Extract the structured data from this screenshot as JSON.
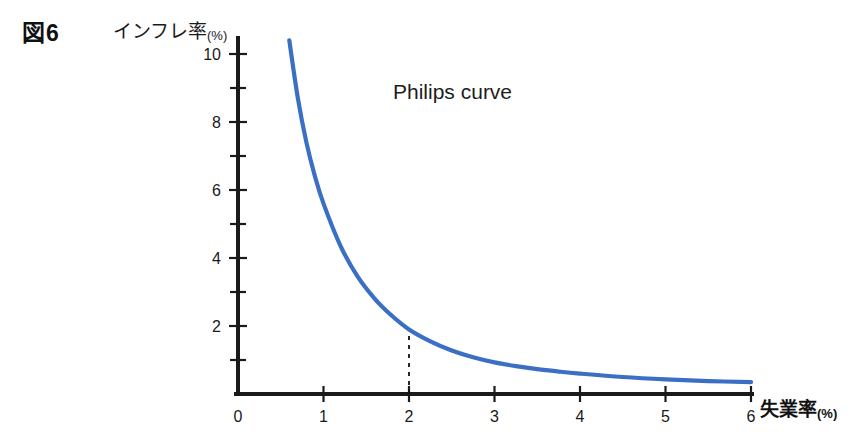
{
  "figure": {
    "number_label": "図6",
    "annotation": "Philips curve"
  },
  "axes": {
    "y_title_text": "インフレ率",
    "y_title_unit": "(%)",
    "x_title_text": "失業率",
    "x_title_unit": "(%)",
    "y_tick_labels": [
      "10",
      "8",
      "6",
      "4",
      "2"
    ],
    "x_tick_labels": [
      "0",
      "1",
      "2",
      "3",
      "4",
      "5",
      "6"
    ]
  },
  "colors": {
    "curve": "#3a6fc4",
    "axis": "#1a1a1a",
    "background": "#ffffff",
    "text": "#1a1a1a"
  },
  "chart_data": {
    "type": "line",
    "title": "Philips curve",
    "xlabel": "失業率(%)",
    "ylabel": "インフレ率(%)",
    "xlim": [
      0,
      6
    ],
    "ylim": [
      0,
      10.5
    ],
    "grid": false,
    "legend": "none",
    "x_ticks_major": [
      0,
      1,
      2,
      3,
      4,
      5,
      6
    ],
    "y_ticks_major": [
      2,
      4,
      6,
      8,
      10
    ],
    "y_ticks_minor": [
      1,
      3,
      5,
      7,
      9
    ],
    "series": [
      {
        "name": "Philips curve",
        "x": [
          0.6,
          0.7,
          0.8,
          0.9,
          1.0,
          1.2,
          1.4,
          1.6,
          1.8,
          2.0,
          2.25,
          2.5,
          2.75,
          3.0,
          3.25,
          3.5,
          3.75,
          4.0,
          4.5,
          5.0,
          5.5,
          6.0
        ],
        "y": [
          10.4,
          8.7,
          7.4,
          6.4,
          5.6,
          4.35,
          3.45,
          2.8,
          2.3,
          1.9,
          1.55,
          1.28,
          1.08,
          0.93,
          0.82,
          0.73,
          0.66,
          0.6,
          0.5,
          0.43,
          0.38,
          0.35
        ]
      }
    ],
    "annotations": [
      {
        "name": "natural-rate-guide",
        "type": "vertical-dashed-line",
        "x": 2.0,
        "y_from": 0.0,
        "y_to": 1.9
      }
    ]
  }
}
